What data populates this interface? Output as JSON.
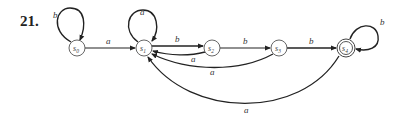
{
  "problem_number": "21.",
  "states": [
    {
      "id": "s0",
      "name": "s",
      "sub": "0",
      "x": 77,
      "y": 48,
      "accepting": false,
      "start": false
    },
    {
      "id": "s1",
      "name": "s",
      "sub": "1",
      "x": 144,
      "y": 48,
      "accepting": false
    },
    {
      "id": "s2",
      "name": "s",
      "sub": "2",
      "x": 212,
      "y": 48,
      "accepting": false
    },
    {
      "id": "s3",
      "name": "s",
      "sub": "3",
      "x": 279,
      "y": 48,
      "accepting": false
    },
    {
      "id": "s4",
      "name": "s",
      "sub": "4",
      "x": 346,
      "y": 48,
      "accepting": true
    }
  ],
  "transitions": [
    {
      "from": "s0",
      "to": "s0",
      "label": "b"
    },
    {
      "from": "s0",
      "to": "s1",
      "label": "a"
    },
    {
      "from": "s1",
      "to": "s1",
      "label": "a"
    },
    {
      "from": "s1",
      "to": "s2",
      "label": "b"
    },
    {
      "from": "s2",
      "to": "s1",
      "label": "a"
    },
    {
      "from": "s2",
      "to": "s3",
      "label": "b"
    },
    {
      "from": "s3",
      "to": "s1",
      "label": "a"
    },
    {
      "from": "s3",
      "to": "s4",
      "label": "b"
    },
    {
      "from": "s4",
      "to": "s4",
      "label": "b"
    },
    {
      "from": "s4",
      "to": "s1",
      "label": "a"
    }
  ]
}
